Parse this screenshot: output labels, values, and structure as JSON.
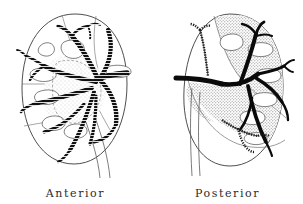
{
  "figure": {
    "panels": [
      {
        "id": "anterior",
        "caption": "Anterior",
        "outline_color": "#3a3a3a",
        "vessel_style": "striped",
        "vessel_color": "#111111",
        "shading": "light-stipple",
        "shading_color": "#bdbdbd"
      },
      {
        "id": "posterior",
        "caption": "Posterior",
        "outline_color": "#3a3a3a",
        "vessel_style": "solid",
        "vessel_color": "#0a0a0a",
        "shading": "dense-stipple",
        "shading_color": "#9a9a9a"
      }
    ],
    "background_color": "#ffffff",
    "label_color": "#2b2b2b"
  }
}
